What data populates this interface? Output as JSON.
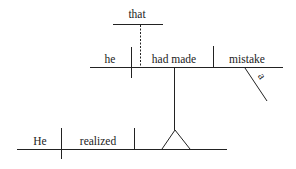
{
  "diagram": {
    "type": "sentence-diagram",
    "sentence": "He realized that he had made a mistake",
    "main_clause": {
      "subject": "He",
      "verb": "realized"
    },
    "noun_clause": {
      "connector": "that",
      "subject": "he",
      "verb": "had made",
      "object": "mistake",
      "modifier": "a"
    },
    "colors": {
      "line": "#222222",
      "text": "#222222",
      "background": "#ffffff"
    }
  }
}
